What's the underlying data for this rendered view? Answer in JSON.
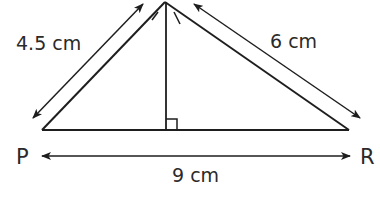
{
  "diagram": {
    "type": "triangle",
    "vertices": {
      "left": {
        "label": "P"
      },
      "right": {
        "label": "R"
      },
      "apex": {
        "label": ""
      }
    },
    "measurements": {
      "left_side": "4.5 cm",
      "right_side": "6 cm",
      "base": "9 cm"
    },
    "features": [
      "altitude from apex to base",
      "right-angle marker at foot of altitude",
      "double-headed dimension arrows"
    ],
    "colors": {
      "line": "#1e1e1e",
      "text": "#2a2a2a",
      "background": "#ffffff"
    }
  }
}
